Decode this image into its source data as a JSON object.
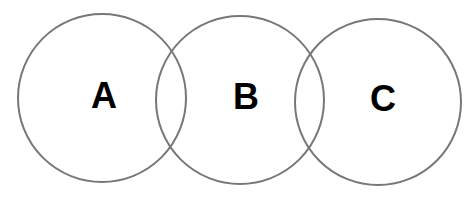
{
  "diagram": {
    "type": "venn",
    "stroke_color": "#777777",
    "label_color": "#000000",
    "circles": [
      {
        "id": "A",
        "label": "A",
        "cx": 102,
        "cy": 98,
        "r": 84,
        "label_x": 104,
        "label_y": 95
      },
      {
        "id": "B",
        "label": "B",
        "cx": 240,
        "cy": 100,
        "r": 84,
        "label_x": 246,
        "label_y": 96
      },
      {
        "id": "C",
        "label": "C",
        "cx": 378,
        "cy": 102,
        "r": 83,
        "label_x": 383,
        "label_y": 98
      }
    ]
  }
}
